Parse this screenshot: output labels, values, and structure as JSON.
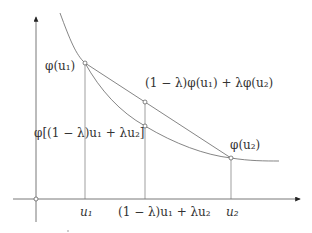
{
  "diagram": {
    "labels": {
      "phi_u1": "φ(u₁)",
      "chord_value": "(1 − λ)φ(u₁) + λφ(u₂)",
      "curve_value": "φ[(1 − λ)u₁ + λu₂]",
      "phi_u2": "φ(u₂)",
      "x_u1": "u₁",
      "x_mid": "(1 − λ)u₁ + λu₂",
      "x_u2": "u₂"
    },
    "points": {
      "origin": [
        36,
        199
      ],
      "phi_u1": [
        85,
        63
      ],
      "chord_mid": [
        145,
        102
      ],
      "curve_mid": [
        145,
        126
      ],
      "phi_u2": [
        231,
        158
      ]
    },
    "colors": {
      "line": "#666666",
      "axis": "#555555",
      "text": "#333333"
    }
  }
}
